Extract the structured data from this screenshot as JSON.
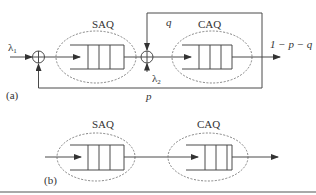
{
  "diagram": {
    "part_a": {
      "label": "(a)",
      "input_rate": "λ",
      "input_rate_sub": "1",
      "second_input_rate": "λ",
      "second_input_rate_sub": "2",
      "queue1_label": "SAQ",
      "queue2_label": "CAQ",
      "feedback_to_caq_label": "q",
      "feedback_to_saq_label": "p",
      "exit_label": "1 − p − q"
    },
    "part_b": {
      "label": "(b)",
      "queue1_label": "SAQ",
      "queue2_label": "CAQ"
    },
    "colors": {
      "line": "#4a4a4a",
      "text": "#333333",
      "background": "#ffffff"
    }
  }
}
